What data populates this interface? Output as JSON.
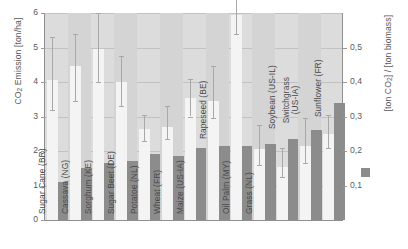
{
  "chart_data": {
    "type": "bar",
    "title": "",
    "subtitle": "",
    "xlabel": "",
    "ylabel": "CO2 Emission [ton/ha]",
    "ylabel_secondary": "[ton CO2] / [ton biomass]",
    "grid": true,
    "legend_position": "right",
    "ylim": [
      0,
      6
    ],
    "ylim_secondary": [
      0.0,
      0.6
    ],
    "yticks": [
      "0",
      "1",
      "2",
      "3",
      "4",
      "5",
      "6"
    ],
    "yticks_secondary": [
      "0,1",
      "0,2",
      "0,3",
      "0,4",
      "0,5"
    ],
    "categories": [
      "Sugar Cane (BR)",
      "Cassava (NG)",
      "Sorghum (KE)",
      "Sugar Beet (DE)",
      "Potatoe (NL)",
      "Wheat (FR)",
      "Maize (US-IA)",
      "Rapeseed (BE)",
      "Oil Palm (MY)",
      "Grass (NL)",
      "Soybean (US-IL)",
      "Switchgrass (US-IA)",
      "Sunflower (FR)"
    ],
    "series": [
      {
        "name": "CO2 Emission [ton/ha]",
        "axis": "left",
        "color": "#f4f4f4",
        "values": [
          4.05,
          4.45,
          4.95,
          4.0,
          2.65,
          2.7,
          3.55,
          3.45,
          5.95,
          2.05,
          1.55,
          2.15,
          2.5
        ],
        "error_high": [
          5.3,
          5.4,
          6.0,
          4.75,
          3.05,
          3.3,
          4.1,
          4.45,
          6.5,
          2.75,
          2.1,
          2.95,
          3.05
        ],
        "error_low": [
          3.2,
          3.45,
          4.0,
          3.3,
          2.3,
          2.35,
          3.0,
          2.95,
          5.4,
          1.6,
          1.25,
          1.65,
          2.1
        ]
      },
      {
        "name": "[ton CO2] / [ton biomass]",
        "axis": "right",
        "color": "#8c8c8c",
        "values": [
          0.11,
          0.15,
          0.165,
          0.17,
          0.19,
          0.185,
          0.21,
          0.215,
          0.215,
          0.22,
          0.235,
          0.26,
          0.34
        ]
      }
    ]
  },
  "legend": {
    "swatch_color": "#8c8c8c",
    "label": "[ton CO2] / [ton biomass]"
  },
  "icons": {
    "legend_swatch": "gray-square-icon"
  }
}
